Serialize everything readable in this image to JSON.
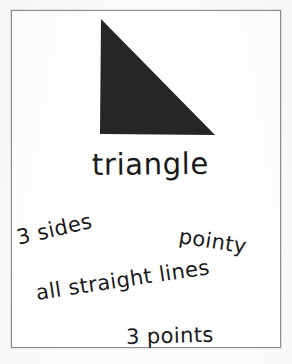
{
  "card": {
    "type": "shape-flashcard",
    "background_color": "#fbfbfa",
    "frame_color": "#8d8d8d",
    "ink_color": "#1a1a1a"
  },
  "shape": {
    "name": "triangle-icon",
    "kind": "right-triangle",
    "fill_color": "#262626",
    "vertices": [
      {
        "label": "apex",
        "x": 101,
        "y": 19
      },
      {
        "label": "bottom-left",
        "x": 100,
        "y": 134
      },
      {
        "label": "bottom-right",
        "x": 215,
        "y": 135
      }
    ]
  },
  "label": {
    "word": "triangle"
  },
  "traits": [
    {
      "id": "sides",
      "text": "3 sides"
    },
    {
      "id": "pointy",
      "text": "pointy"
    },
    {
      "id": "straight-lines",
      "text": "all straight lines"
    },
    {
      "id": "points",
      "text": "3 points"
    }
  ]
}
